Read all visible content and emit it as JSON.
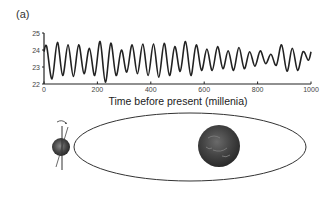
{
  "panel_label": "(a)",
  "chart_data": {
    "type": "line",
    "title": "",
    "xlabel": "Time before present (millenia)",
    "ylabel": "",
    "xlim": [
      0,
      1000
    ],
    "ylim": [
      22,
      25
    ],
    "xticks": [
      0,
      200,
      400,
      600,
      800,
      1000
    ],
    "yticks": [
      22,
      23,
      24,
      25
    ],
    "grid": false,
    "series": [
      {
        "name": "obliquity",
        "color": "#222222",
        "x": [
          0,
          10,
          30,
          50,
          70,
          90,
          110,
          130,
          150,
          170,
          190,
          210,
          230,
          250,
          270,
          290,
          310,
          330,
          350,
          370,
          390,
          410,
          430,
          450,
          470,
          490,
          510,
          530,
          550,
          570,
          590,
          610,
          630,
          650,
          670,
          690,
          710,
          730,
          750,
          770,
          790,
          810,
          830,
          850,
          870,
          890,
          910,
          930,
          950,
          970,
          990,
          1000
        ],
        "values": [
          23.9,
          24.2,
          22.3,
          24.45,
          22.5,
          24.3,
          22.45,
          24.3,
          22.6,
          24.1,
          22.5,
          24.5,
          22.1,
          24.4,
          22.5,
          24.0,
          22.7,
          24.3,
          22.6,
          24.35,
          22.5,
          24.35,
          22.4,
          24.4,
          22.5,
          24.2,
          22.75,
          24.5,
          22.5,
          24.3,
          22.8,
          24.05,
          22.8,
          24.2,
          22.9,
          23.95,
          22.8,
          24.15,
          22.9,
          23.9,
          23.05,
          23.95,
          23.2,
          23.75,
          23.1,
          24.3,
          22.75,
          24.1,
          22.8,
          23.9,
          23.4,
          23.9
        ]
      }
    ]
  },
  "diagram": {
    "type": "orbit",
    "left_body": "earth-with-tilted-axis",
    "right_body": "sun"
  }
}
